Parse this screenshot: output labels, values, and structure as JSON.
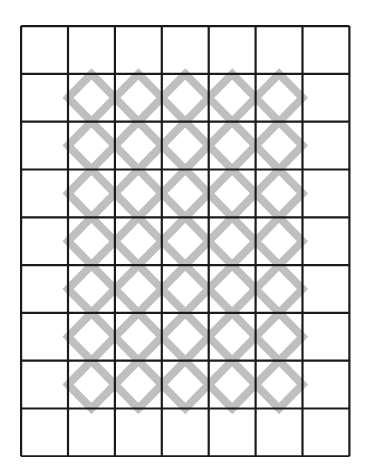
{
  "figure": {
    "title": "",
    "type": "grid-lattice-pattern",
    "background_color": "#ffffff"
  },
  "grid": {
    "columns": 7,
    "rows": 9,
    "origin_x": 20,
    "origin_y": 25,
    "cell_width": 46.9,
    "cell_height": 47.8,
    "line_color": "#1a1a1a",
    "line_width": 2.2,
    "cell_fill": "#ffffff"
  },
  "pattern": {
    "shape": "diamond",
    "description": "inscribed rotated square outline touching cell edge midpoints",
    "stroke_color": "#bfbfbf",
    "stroke_width": 8,
    "fill": "none",
    "first_column": 2,
    "last_column": 6,
    "first_row": 2,
    "last_row": 8,
    "filled_cell_count": 35,
    "empty_cell_count": 28,
    "occupancy": [
      [
        0,
        0,
        0,
        0,
        0,
        0,
        0
      ],
      [
        0,
        1,
        1,
        1,
        1,
        1,
        0
      ],
      [
        0,
        1,
        1,
        1,
        1,
        1,
        0
      ],
      [
        0,
        1,
        1,
        1,
        1,
        1,
        0
      ],
      [
        0,
        1,
        1,
        1,
        1,
        1,
        0
      ],
      [
        0,
        1,
        1,
        1,
        1,
        1,
        0
      ],
      [
        0,
        1,
        1,
        1,
        1,
        1,
        0
      ],
      [
        0,
        1,
        1,
        1,
        1,
        1,
        0
      ],
      [
        0,
        0,
        0,
        0,
        0,
        0,
        0
      ]
    ]
  }
}
